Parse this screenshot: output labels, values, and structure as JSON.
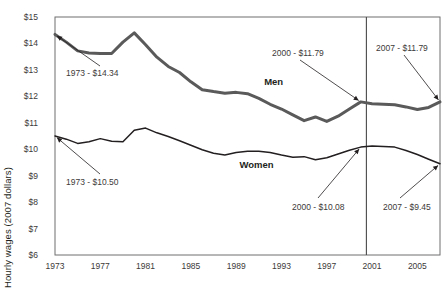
{
  "chart_data": {
    "type": "line",
    "title": "",
    "xlabel": "",
    "ylabel": "Hourly wages (2007 dollars)",
    "ylim": [
      6,
      15
    ],
    "xlim": [
      1973,
      2007
    ],
    "grid": false,
    "legend_position": "inline-labels",
    "ytick_labels": [
      "$15",
      "$14",
      "$13",
      "$12",
      "$11",
      "$10",
      "$9",
      "$8",
      "$7",
      "$6"
    ],
    "ytick_values": [
      15,
      14,
      13,
      12,
      11,
      10,
      9,
      8,
      7,
      6
    ],
    "xtick_labels": [
      "1973",
      "1977",
      "1981",
      "1985",
      "1989",
      "1993",
      "1997",
      "2001",
      "2005"
    ],
    "xtick_values": [
      1973,
      1977,
      1981,
      1985,
      1989,
      1993,
      1997,
      2001,
      2005
    ],
    "x": [
      1973,
      1974,
      1975,
      1976,
      1977,
      1978,
      1979,
      1980,
      1981,
      1982,
      1983,
      1984,
      1985,
      1986,
      1987,
      1988,
      1989,
      1990,
      1991,
      1992,
      1993,
      1994,
      1995,
      1996,
      1997,
      1998,
      1999,
      2000,
      2001,
      2002,
      2003,
      2004,
      2005,
      2006,
      2007
    ],
    "series": [
      {
        "name": "Men",
        "label": "Men",
        "color": "#5a5a5a",
        "values": [
          14.34,
          14.05,
          13.72,
          13.64,
          13.62,
          13.62,
          14.05,
          14.4,
          13.95,
          13.48,
          13.13,
          12.9,
          12.55,
          12.25,
          12.18,
          12.12,
          12.15,
          12.1,
          11.92,
          11.7,
          11.52,
          11.3,
          11.08,
          11.22,
          11.05,
          11.25,
          11.52,
          11.79,
          11.72,
          11.7,
          11.68,
          11.6,
          11.5,
          11.58,
          11.79
        ]
      },
      {
        "name": "Women",
        "label": "Women",
        "color": "#231f20",
        "values": [
          10.5,
          10.38,
          10.22,
          10.28,
          10.4,
          10.3,
          10.28,
          10.72,
          10.8,
          10.62,
          10.48,
          10.32,
          10.15,
          9.98,
          9.85,
          9.78,
          9.88,
          9.92,
          9.92,
          9.88,
          9.78,
          9.7,
          9.72,
          9.6,
          9.68,
          9.82,
          9.96,
          10.08,
          10.12,
          10.1,
          10.08,
          9.95,
          9.8,
          9.62,
          9.45
        ]
      }
    ],
    "reference_line": {
      "x": 2000.5,
      "label": ""
    },
    "annotations": [
      {
        "id": "men-1973",
        "text": "1973 - $14.34",
        "point_x": 1973,
        "point_y": 14.34,
        "series": "Men"
      },
      {
        "id": "men-2000",
        "text": "2000 - $11.79",
        "point_x": 2000,
        "point_y": 11.79,
        "series": "Men"
      },
      {
        "id": "men-2007",
        "text": "2007 - $11.79",
        "point_x": 2007,
        "point_y": 11.79,
        "series": "Men"
      },
      {
        "id": "women-1973",
        "text": "1973 - $10.50",
        "point_x": 1973,
        "point_y": 10.5,
        "series": "Women"
      },
      {
        "id": "women-2000",
        "text": "2000 - $10.08",
        "point_x": 2000,
        "point_y": 10.08,
        "series": "Women"
      },
      {
        "id": "women-2007",
        "text": "2007 - $9.45",
        "point_x": 2007,
        "point_y": 9.45,
        "series": "Women"
      }
    ]
  }
}
